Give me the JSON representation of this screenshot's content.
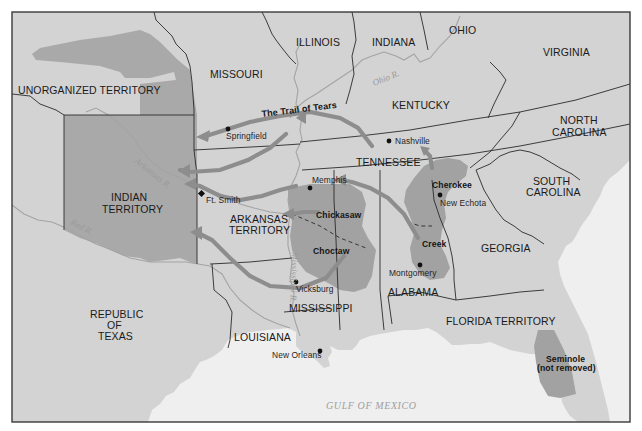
{
  "map": {
    "title": "The Trail of Tears",
    "colors": {
      "land": "#d3d3d3",
      "water": "#efefef",
      "indian_territory": "#a9a9a9",
      "tribal_land": "#a2a2a2",
      "arrow": "#8d8d8d",
      "border": "#2a2a2a",
      "frame": "#3a3a3a"
    },
    "regions": {
      "illinois": "ILLINOIS",
      "indiana": "INDIANA",
      "ohio": "OHIO",
      "virginia": "VIRGINIA",
      "missouri": "MISSOURI",
      "unorganized_territory": "UNORGANIZED TERRITORY",
      "kentucky": "KENTUCKY",
      "north_carolina_1": "NORTH",
      "north_carolina_2": "CAROLINA",
      "tennessee": "TENNESSEE",
      "south_carolina_1": "SOUTH",
      "south_carolina_2": "CAROLINA",
      "indian_territory_1": "INDIAN",
      "indian_territory_2": "TERRITORY",
      "arkansas_territory_1": "ARKANSAS",
      "arkansas_territory_2": "TERRITORY",
      "georgia": "GEORGIA",
      "republic_of_texas_1": "REPUBLIC",
      "republic_of_texas_2": "OF",
      "republic_of_texas_3": "TEXAS",
      "mississippi": "MISSISSIPPI",
      "alabama": "ALABAMA",
      "louisiana": "LOUISIANA",
      "florida_territory": "FLORIDA TERRITORY"
    },
    "cities": {
      "springfield": "Springfield",
      "nashville": "Nashville",
      "memphis": "Memphis",
      "ft_smith": "Ft. Smith",
      "new_echota": "New Echota",
      "montgomery": "Montgomery",
      "vicksburg": "Vicksburg",
      "new_orleans": "New Orleans"
    },
    "tribes": {
      "cherokee": "Cherokee",
      "chickasaw": "Chickasaw",
      "choctaw": "Choctaw",
      "creek": "Creek",
      "seminole_1": "Seminole",
      "seminole_2": "(not removed)"
    },
    "rivers": {
      "ohio": "Ohio R.",
      "arkansas": "Arkansas R.",
      "red": "Red R.",
      "mississippi": "Mississippi R."
    },
    "water_bodies": {
      "gulf": "GULF OF MEXICO"
    }
  }
}
